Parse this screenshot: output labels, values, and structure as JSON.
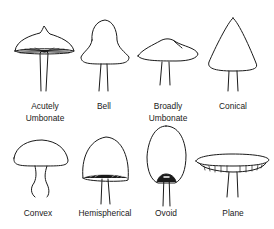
{
  "shapes": [
    {
      "id": "acutely-umbonate",
      "label_line1": "Acutely",
      "label_line2": "Umbonate"
    },
    {
      "id": "bell",
      "label_line1": "Bell",
      "label_line2": ""
    },
    {
      "id": "broadly-umbonate",
      "label_line1": "Broadly",
      "label_line2": "Umbonate"
    },
    {
      "id": "conical",
      "label_line1": "Conical",
      "label_line2": ""
    },
    {
      "id": "convex",
      "label_line1": "Convex",
      "label_line2": ""
    },
    {
      "id": "hemispherical",
      "label_line1": "Hemispherical",
      "label_line2": ""
    },
    {
      "id": "ovoid",
      "label_line1": "Ovoid",
      "label_line2": ""
    },
    {
      "id": "plane",
      "label_line1": "Plane",
      "label_line2": ""
    }
  ],
  "colors": {
    "line": "#1a1a1a",
    "background": "#ffffff"
  }
}
